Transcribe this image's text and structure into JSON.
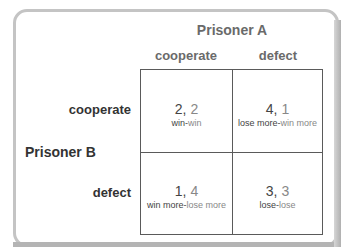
{
  "colors": {
    "frame_border": "#c4c4c4",
    "grid_line": "#5a5a5a",
    "player_a_text": "#6a6a6a",
    "player_b_text": "#333333",
    "payoff_first": "#444444",
    "payoff_second": "#888888"
  },
  "column_player": {
    "label": "Prisoner A",
    "strategies": [
      "cooperate",
      "defect"
    ]
  },
  "row_player": {
    "label": "Prisoner B",
    "strategies": [
      "cooperate",
      "defect"
    ]
  },
  "cells": [
    [
      {
        "first": "2,",
        "second": " 2",
        "outcome_first": "win-",
        "outcome_second": "win"
      },
      {
        "first": "4,",
        "second": " 1",
        "outcome_first": "lose more-",
        "outcome_second": "win more"
      }
    ],
    [
      {
        "first": "1,",
        "second": " 4",
        "outcome_first": "win more-",
        "outcome_second": "lose more"
      },
      {
        "first": "3,",
        "second": " 3",
        "outcome_first": "lose-",
        "outcome_second": "lose"
      }
    ]
  ]
}
